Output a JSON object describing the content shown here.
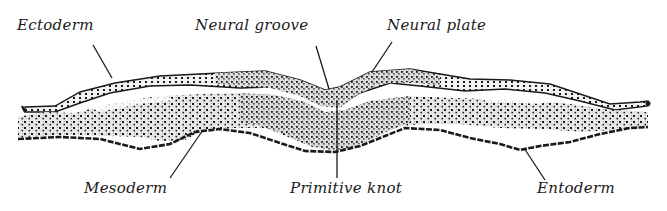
{
  "figure": {
    "type": "anatomical cross-section",
    "labels": {
      "ectoderm": "Ectoderm",
      "neural_groove": "Neural groove",
      "neural_plate": "Neural plate",
      "mesoderm": "Mesoderm",
      "primitive_knot": "Primitive knot",
      "entoderm": "Entoderm"
    },
    "colors": {
      "ink": "#1a1a1a",
      "background": "#ffffff",
      "stipple": "#9a9a9a"
    }
  }
}
